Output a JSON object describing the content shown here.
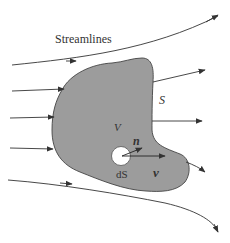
{
  "diagram": {
    "title_label": "Streamlines",
    "labels": {
      "surface": "S",
      "volume": "V",
      "normal": "n",
      "velocity": "v",
      "area_element": "dS"
    },
    "colors": {
      "region_fill": "#999999",
      "region_stroke": "#444444",
      "line": "#333333",
      "background": "#ffffff",
      "area_element_fill": "#ffffff"
    },
    "streamlines": [
      {
        "id": "streamline-1",
        "passes_through_region": false
      },
      {
        "id": "streamline-2",
        "passes_through_region": true
      },
      {
        "id": "streamline-3",
        "passes_through_region": true
      },
      {
        "id": "streamline-4",
        "passes_through_region": true
      },
      {
        "id": "streamline-5",
        "passes_through_region": false
      }
    ]
  }
}
